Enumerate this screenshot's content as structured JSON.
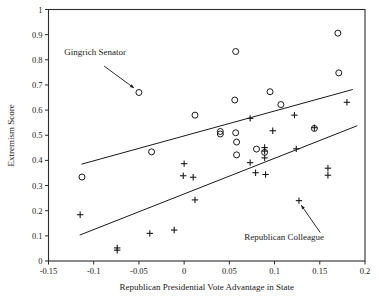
{
  "chart_data": {
    "type": "scatter",
    "title": "",
    "xlabel": "Republican Presidential Vote Advantage in State",
    "ylabel": "Extremism Score",
    "xlim": [
      -0.15,
      0.2
    ],
    "ylim": [
      0,
      1
    ],
    "grid": false,
    "legend_position": "none",
    "xticks": [
      "-0.15",
      "-0.1",
      "-0.05",
      "0",
      "0.05",
      "0.1",
      "0.15",
      "0.2"
    ],
    "xtick_values": [
      -0.15,
      -0.1,
      -0.05,
      0,
      0.05,
      0.1,
      0.15,
      0.2
    ],
    "yticks": [
      "0",
      "0.1",
      "0.2",
      "0.3",
      "0.4",
      "0.5",
      "0.6",
      "0.7",
      "0.8",
      "0.9",
      "1"
    ],
    "ytick_values": [
      0,
      0.1,
      0.2,
      0.3,
      0.4,
      0.5,
      0.6,
      0.7,
      0.8,
      0.9,
      1
    ],
    "series": [
      {
        "name": "Gingrich Senator",
        "marker": "circle",
        "points": [
          [
            -0.113,
            0.334
          ],
          [
            -0.05,
            0.67
          ],
          [
            -0.036,
            0.434
          ],
          [
            0.012,
            0.58
          ],
          [
            0.04,
            0.515
          ],
          [
            0.04,
            0.505
          ],
          [
            0.056,
            0.64
          ],
          [
            0.057,
            0.833
          ],
          [
            0.057,
            0.51
          ],
          [
            0.058,
            0.473
          ],
          [
            0.058,
            0.422
          ],
          [
            0.08,
            0.445
          ],
          [
            0.089,
            0.432
          ],
          [
            0.095,
            0.673
          ],
          [
            0.107,
            0.622
          ],
          [
            0.144,
            0.527
          ],
          [
            0.17,
            0.906
          ],
          [
            0.171,
            0.748
          ]
        ]
      },
      {
        "name": "Republican Colleague",
        "marker": "plus",
        "points": [
          [
            -0.115,
            0.184
          ],
          [
            -0.074,
            0.052
          ],
          [
            -0.074,
            0.043
          ],
          [
            -0.038,
            0.11
          ],
          [
            -0.011,
            0.123
          ],
          [
            -0.001,
            0.339
          ],
          [
            0.0,
            0.387
          ],
          [
            0.01,
            0.333
          ],
          [
            0.012,
            0.243
          ],
          [
            0.073,
            0.567
          ],
          [
            0.073,
            0.391
          ],
          [
            0.079,
            0.351
          ],
          [
            0.089,
            0.451
          ],
          [
            0.089,
            0.437
          ],
          [
            0.089,
            0.41
          ],
          [
            0.09,
            0.344
          ],
          [
            0.098,
            0.518
          ],
          [
            0.122,
            0.58
          ],
          [
            0.124,
            0.446
          ],
          [
            0.127,
            0.24
          ],
          [
            0.144,
            0.53
          ],
          [
            0.159,
            0.369
          ],
          [
            0.159,
            0.341
          ],
          [
            0.18,
            0.631
          ]
        ]
      }
    ],
    "trend_lines": [
      {
        "name": "gingrich-senator-fit",
        "x0": -0.1135,
        "y0": 0.385,
        "x1": 0.1865,
        "y1": 0.682
      },
      {
        "name": "republican-colleague-fit",
        "x0": -0.1155,
        "y0": 0.103,
        "x1": 0.1915,
        "y1": 0.538
      }
    ],
    "annotations": [
      {
        "name": "gingrich-senator",
        "text": "Gingrich Senator",
        "text_x": -0.0985,
        "text_y": 0.818,
        "arrow_from_x": -0.0885,
        "arrow_from_y": 0.775,
        "arrow_to_x": -0.0555,
        "arrow_to_y": 0.688
      },
      {
        "name": "republican-colleague",
        "text": "Republican Colleague",
        "text_x": 0.1105,
        "text_y": 0.084,
        "arrow_from_x": 0.1505,
        "arrow_from_y": 0.113,
        "arrow_to_x": 0.1295,
        "arrow_to_y": 0.222
      }
    ]
  },
  "colors": {
    "axis": "#2b2b2b",
    "marker": "#1a1a1a",
    "line": "#1a1a1a",
    "background": "#ffffff"
  }
}
